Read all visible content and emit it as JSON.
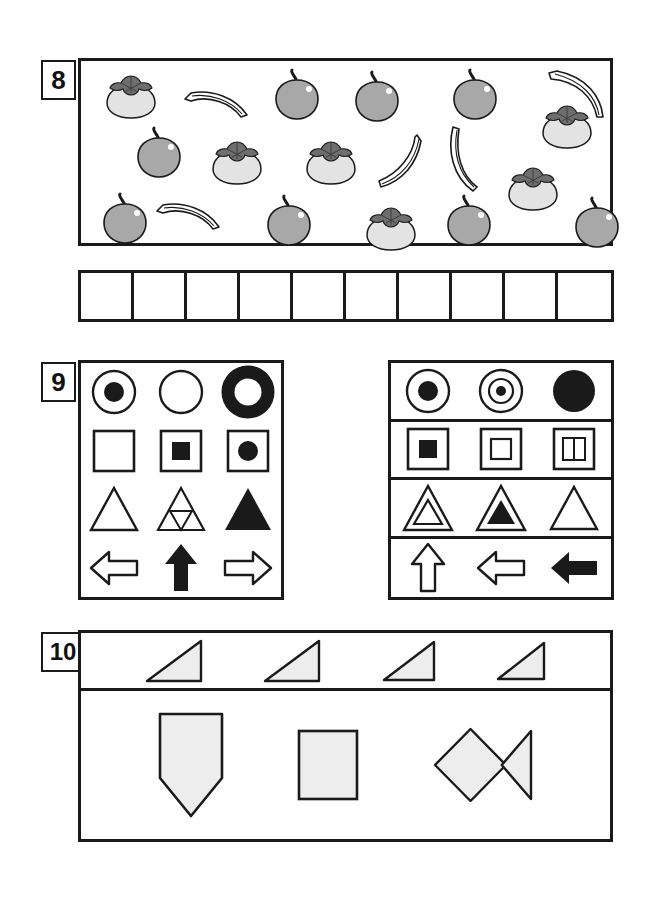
{
  "worksheet": {
    "background": "#ffffff",
    "ink": "#1a1a1a",
    "fill_gray": "#ededed",
    "fruit_gray": "#a8a8a8",
    "persimmon_body": "#e3e3e3",
    "persimmon_leaf": "#6e6e6e"
  },
  "questions": [
    {
      "number": "8",
      "type": "count-and-tally",
      "panel": {
        "name": "fruit-field",
        "fruits": [
          {
            "kind": "persimmon",
            "x": 22,
            "y": 12,
            "w": 56,
            "h": 46,
            "row": 1
          },
          {
            "kind": "banana",
            "x": 100,
            "y": 22,
            "w": 72,
            "h": 40,
            "row": 1,
            "flip": "right-down"
          },
          {
            "kind": "apple",
            "x": 190,
            "y": 8,
            "w": 52,
            "h": 52,
            "row": 1
          },
          {
            "kind": "apple",
            "x": 270,
            "y": 10,
            "w": 52,
            "h": 52,
            "row": 1
          },
          {
            "kind": "apple",
            "x": 368,
            "y": 8,
            "w": 52,
            "h": 52,
            "row": 1
          },
          {
            "kind": "banana",
            "x": 462,
            "y": 6,
            "w": 66,
            "h": 54,
            "row": 1,
            "flip": "arc-right"
          },
          {
            "kind": "persimmon",
            "x": 458,
            "y": 42,
            "w": 56,
            "h": 46,
            "row": 1
          },
          {
            "kind": "apple",
            "x": 52,
            "y": 66,
            "w": 52,
            "h": 52,
            "row": 2
          },
          {
            "kind": "persimmon",
            "x": 128,
            "y": 78,
            "w": 56,
            "h": 46,
            "row": 2
          },
          {
            "kind": "persimmon",
            "x": 222,
            "y": 78,
            "w": 56,
            "h": 46,
            "row": 2
          },
          {
            "kind": "banana",
            "x": 288,
            "y": 68,
            "w": 56,
            "h": 62,
            "row": 2,
            "flip": "steep"
          },
          {
            "kind": "banana",
            "x": 362,
            "y": 62,
            "w": 48,
            "h": 70,
            "row": 2,
            "flip": "vertical"
          },
          {
            "kind": "persimmon",
            "x": 424,
            "y": 104,
            "w": 56,
            "h": 46,
            "row": 2
          },
          {
            "kind": "apple",
            "x": 18,
            "y": 132,
            "w": 52,
            "h": 52,
            "row": 3
          },
          {
            "kind": "banana",
            "x": 72,
            "y": 134,
            "w": 72,
            "h": 40,
            "row": 3,
            "flip": "right-down"
          },
          {
            "kind": "apple",
            "x": 182,
            "y": 134,
            "w": 52,
            "h": 52,
            "row": 3
          },
          {
            "kind": "persimmon",
            "x": 282,
            "y": 144,
            "w": 56,
            "h": 46,
            "row": 3
          },
          {
            "kind": "apple",
            "x": 362,
            "y": 134,
            "w": 52,
            "h": 52,
            "row": 3
          },
          {
            "kind": "apple",
            "x": 490,
            "y": 136,
            "w": 52,
            "h": 52,
            "row": 3
          }
        ],
        "totals": {
          "apple": 8,
          "persimmon": 6,
          "banana": 5
        }
      },
      "answer_grid": {
        "name": "tally-grid",
        "cells": 10,
        "values": [
          "",
          "",
          "",
          "",
          "",
          "",
          "",
          "",
          "",
          ""
        ]
      }
    },
    {
      "number": "9",
      "type": "shape-matching",
      "left_panel": {
        "name": "shape-panel-left",
        "rows": [
          [
            {
              "shape": "circle-outline-with-filled-dot",
              "label": "circle with filled center dot"
            },
            {
              "shape": "circle-outline",
              "label": "empty circle"
            },
            {
              "shape": "thick-ring",
              "label": "filled ring donut"
            }
          ],
          [
            {
              "shape": "square-outline",
              "label": "empty square"
            },
            {
              "shape": "square-with-filled-square",
              "label": "square containing filled square"
            },
            {
              "shape": "square-with-filled-circle",
              "label": "square containing filled circle"
            }
          ],
          [
            {
              "shape": "triangle-outline",
              "label": "empty triangle"
            },
            {
              "shape": "triangle-with-inverted-inner",
              "label": "triangle with inverted inner triangle"
            },
            {
              "shape": "triangle-filled",
              "label": "solid black triangle"
            }
          ],
          [
            {
              "shape": "arrow-left-outline",
              "label": "left arrow outline"
            },
            {
              "shape": "arrow-up-filled",
              "label": "up arrow filled"
            },
            {
              "shape": "arrow-right-outline",
              "label": "right arrow outline"
            }
          ]
        ]
      },
      "right_panel": {
        "name": "shape-panel-right",
        "rows": [
          [
            {
              "shape": "circle-outline-with-filled-dot",
              "label": "circle with filled center dot"
            },
            {
              "shape": "circle-double-ring-with-dot",
              "label": "double ring circle with small dot"
            },
            {
              "shape": "circle-filled",
              "label": "solid black circle"
            }
          ],
          [
            {
              "shape": "square-with-filled-square",
              "label": "square containing filled square"
            },
            {
              "shape": "square-with-empty-square",
              "label": "square containing empty square"
            },
            {
              "shape": "square-with-two-bars",
              "label": "square containing two vertical bars"
            }
          ],
          [
            {
              "shape": "triangle-nested-outline",
              "label": "triangle with inner outline triangle"
            },
            {
              "shape": "triangle-with-filled-inner",
              "label": "triangle with filled inner triangle"
            },
            {
              "shape": "triangle-outline",
              "label": "empty triangle"
            }
          ],
          [
            {
              "shape": "arrow-up-outline",
              "label": "up arrow outline"
            },
            {
              "shape": "arrow-left-outline",
              "label": "left arrow outline"
            },
            {
              "shape": "arrow-left-filled",
              "label": "left arrow filled"
            }
          ]
        ]
      }
    },
    {
      "number": "10",
      "type": "shape-composition",
      "top_row": {
        "name": "triangle-strip",
        "items": [
          {
            "shape": "right-triangle",
            "label": "right triangle",
            "w": 58,
            "h": 44
          },
          {
            "shape": "right-triangle",
            "label": "right triangle",
            "w": 58,
            "h": 44
          },
          {
            "shape": "right-triangle",
            "label": "right triangle",
            "w": 54,
            "h": 42
          },
          {
            "shape": "right-triangle",
            "label": "right triangle",
            "w": 50,
            "h": 40
          }
        ]
      },
      "bottom_row": {
        "name": "composite-shape-strip",
        "items": [
          {
            "shape": "pentagon-point-down",
            "label": "downward pointing pentagon",
            "w": 68,
            "h": 108
          },
          {
            "shape": "square",
            "label": "square",
            "w": 64,
            "h": 74
          },
          {
            "shape": "diamond-with-triangle",
            "label": "diamond joined to left pointing triangle",
            "w": 104,
            "h": 80
          }
        ]
      }
    }
  ]
}
